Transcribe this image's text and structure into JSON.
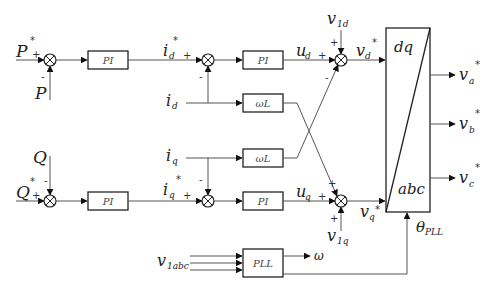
{
  "diagram": {
    "inputs": {
      "p_ref": "P",
      "p_ref_sup": "*",
      "p_meas": "P",
      "q_meas": "Q",
      "q_ref": "Q",
      "q_ref_sup": "*",
      "id": "i",
      "id_sub": "d",
      "iq": "i",
      "iq_sub": "q",
      "v1d": "v",
      "v1d_sub": "1d",
      "v1q": "v",
      "v1q_sub": "1q",
      "v1abc": "v",
      "v1abc_sub": "1abc"
    },
    "signals": {
      "id_ref": "i",
      "id_ref_sub": "d",
      "id_ref_sup": "*",
      "iq_ref": "i",
      "iq_ref_sub": "q",
      "iq_ref_sup": "*",
      "ud": "u",
      "ud_sub": "d",
      "uq": "u",
      "uq_sub": "q",
      "vd_ref": "v",
      "vd_ref_sub": "d",
      "vd_ref_sup": "*",
      "vq_ref": "v",
      "vq_ref_sub": "q",
      "vq_ref_sup": "*",
      "omega": "ω",
      "theta": "θ",
      "theta_sub": "PLL"
    },
    "outputs": {
      "va": "v",
      "va_sub": "a",
      "va_sup": "*",
      "vb": "v",
      "vb_sub": "b",
      "vb_sup": "*",
      "vc": "v",
      "vc_sub": "c",
      "vc_sup": "*"
    },
    "blocks": {
      "pi_p": "PI",
      "pi_q": "PI",
      "pi_d": "PI",
      "pi_iq": "PI",
      "wl_d": "ωL",
      "wl_q": "ωL",
      "pll": "PLL",
      "transform_top": "dq",
      "transform_bottom": "abc"
    },
    "signs": {
      "plus": "+",
      "minus": "-"
    }
  }
}
